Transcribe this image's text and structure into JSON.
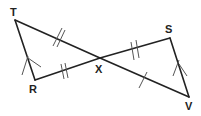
{
  "diagram": {
    "type": "geometry-two-triangles",
    "points": {
      "T": {
        "label": "T",
        "x": 15,
        "y": 20
      },
      "R": {
        "label": "R",
        "x": 35,
        "y": 80
      },
      "X": {
        "label": "X",
        "x": 100,
        "y": 58
      },
      "S": {
        "label": "S",
        "x": 170,
        "y": 38
      },
      "V": {
        "label": "V",
        "x": 189,
        "y": 97
      }
    },
    "segments": [
      {
        "from": "T",
        "to": "X",
        "ticks": 2
      },
      {
        "from": "T",
        "to": "R",
        "ticks": 1
      },
      {
        "from": "R",
        "to": "X",
        "ticks": 2
      },
      {
        "from": "X",
        "to": "S",
        "ticks": 2
      },
      {
        "from": "S",
        "to": "V",
        "ticks": 1
      },
      {
        "from": "X",
        "to": "V",
        "ticks": 1
      }
    ],
    "line_color": "#222222",
    "background": "#ffffff"
  }
}
